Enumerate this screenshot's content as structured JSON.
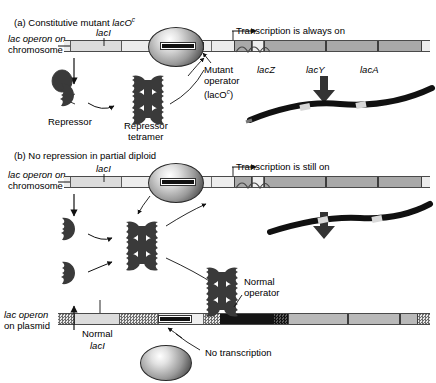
{
  "figure": {
    "panels": [
      {
        "id": "a",
        "heading_prefix": "(a)",
        "heading": "Constitutive mutant",
        "heading_gene": "lacO",
        "heading_sup": "c",
        "row_label_line1": "lac operon on",
        "row_label_line2": "chromosome",
        "lacI_label": "lacI",
        "transcription_label": "Transcription is always on",
        "genes": [
          "lacZ",
          "lacY",
          "lacA"
        ],
        "operator_label_line1": "Mutant",
        "operator_label_line2": "operator",
        "operator_label_line3": "(lacO",
        "operator_label_sup": "c",
        "operator_label_close": ")",
        "repressor_label": "Repressor",
        "tetramer_label_line1": "Repressor",
        "tetramer_label_line2": "tetramer"
      },
      {
        "id": "b",
        "heading_prefix": "(b)",
        "heading": "No repression in partial diploid",
        "row_label_line1": "lac operon on",
        "row_label_line2": "chromosome",
        "lacI_label": "lacI",
        "transcription_label": "Transcription is still on",
        "plasmid_label_line1": "lac operon",
        "plasmid_label_line2": "on plasmid",
        "normal_lacI_line1": "Normal",
        "normal_lacI_line2": "lacI",
        "normal_operator_line1": "Normal",
        "normal_operator_line2": "operator",
        "no_transcription_label": "No transcription"
      }
    ],
    "colors": {
      "gene_fill": "#a9a9a9",
      "plasmid_gene_fill": "#b9b9b9",
      "backbone_fill": "#ededed",
      "lacI_fill": "#dcdcdc",
      "protein_dark": "#3a3a3a",
      "operator_dark": "#141414",
      "transcript_black": "#111111"
    }
  }
}
